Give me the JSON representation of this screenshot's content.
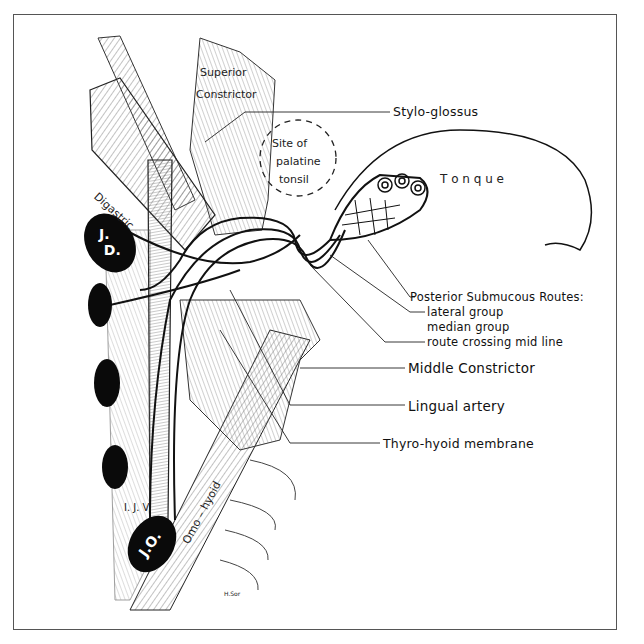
{
  "figure": {
    "callout_labels": {
      "stylo_glossus": "Stylo-glossus",
      "posterior_submucous_routes": "Posterior Submucous Routes:",
      "lateral_group": "lateral group",
      "median_group": "median group",
      "route_crossing_mid_line": "route crossing mid line",
      "middle_constrictor": "Middle Constrictor",
      "lingual_artery": "Lingual artery",
      "thyro_hyoid_membrane": "Thyro-hyoid membrane"
    },
    "inline_labels": {
      "superior": "Superior",
      "constrictor": "Constrictor",
      "site_of": "Site of",
      "palatine": "palatine",
      "tonsil": "tonsil",
      "tongue": "T o n q u e",
      "digastric": "Digastric",
      "ijv": "I. J. V.",
      "omo_hyoid": "Omo – hyoid",
      "signature": "H.Sor"
    },
    "lymph_nodes": {
      "jugulodigastric": "J.D.",
      "jugulo_omohyoid": "J.O."
    },
    "colors": {
      "ink": "#111111",
      "hatch": "#555555",
      "background": "#ffffff",
      "node_fill": "#0a0a0a"
    }
  }
}
